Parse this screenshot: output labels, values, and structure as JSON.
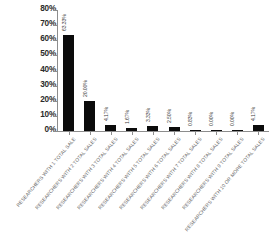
{
  "chart_data": {
    "type": "bar",
    "title": "",
    "xlabel": "",
    "ylabel": "",
    "ylim": [
      0,
      80
    ],
    "grid": false,
    "legend": false,
    "y_tick_labels": [
      "80%",
      "70%",
      "60%",
      "50%",
      "40%",
      "30%",
      "20%",
      "10%",
      "0%"
    ],
    "y_tick_values": [
      80,
      70,
      60,
      50,
      40,
      30,
      20,
      10,
      0
    ],
    "categories": [
      "RESEARCHERS WITH 1 TOTAL SALE",
      "RESEARCHERS WITH 2 TOTAL SALES",
      "RESEARCHERS WITH 3 TOTAL SALES",
      "RESEARCHERS WITH 4 TOTAL SALES",
      "RESEARCHERS WITH 5 TOTAL SALES",
      "RESEARCHERS WITH 6 TOTAL SALES",
      "RESEARCHERS WITH 7 TOTAL SALES",
      "RESEARCHERS WITH 8 TOTAL SALES",
      "RESEARCHERS WITH 9 TOTAL SALES",
      "RESEARCHERS WITH 10 OR MORE TOTAL SALES"
    ],
    "values": [
      63.33,
      20.0,
      4.17,
      1.67,
      3.33,
      2.5,
      0.83,
      0.0,
      0.0,
      4.17
    ],
    "value_labels": [
      "63.33%",
      "20.00%",
      "4.17%",
      "1.67%",
      "3.33%",
      "2.50%",
      "0.83%",
      "0.00%",
      "0.00%",
      "4.17%"
    ],
    "bar_color": "#0b0b0b",
    "axis_color": "#8d8d8d",
    "background_color": "#ffffff"
  }
}
